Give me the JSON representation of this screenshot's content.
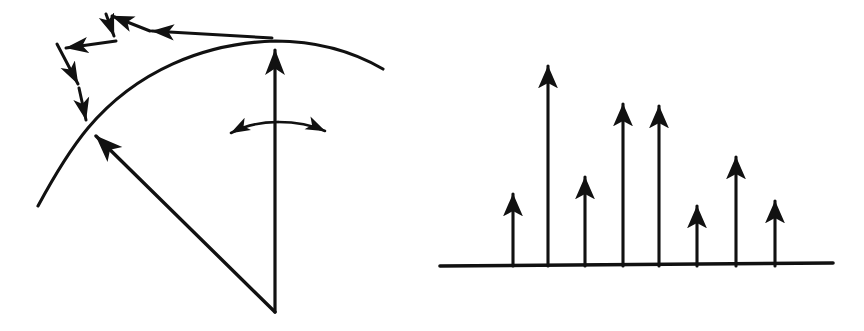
{
  "figure": {
    "width": 864,
    "height": 331,
    "background_color": "#ffffff",
    "ink_color": "#111111",
    "panel_count": 2,
    "caption": ""
  },
  "panels": [
    {
      "id": "left-panel",
      "name": "scattering-geometry-diagram",
      "label": "",
      "description": "Hand-drawn scattering / wavefront diagram: a zigzag arrowed ray path travelling leftward and downward to a vertex, a curved wavefront arc through that vertex, a straight radius arrow from an apex to the vertex, a vertical axis arrow, and a double-headed arc indicating angular sweep.",
      "elements": [
        {
          "name": "zigzag-ray-path",
          "type": "polyline-with-arrowheads",
          "direction": "right-to-left-then-down",
          "segment_count": 6,
          "arrowhead_count": 5,
          "points": [
            [
              272,
              38
            ],
            [
              118,
              29
            ],
            [
              107,
              13
            ],
            [
              115,
              39
            ],
            [
              89,
              53
            ],
            [
              57,
              43
            ],
            [
              71,
              57
            ],
            [
              81,
              90
            ],
            [
              80,
              104
            ],
            [
              88,
              128
            ]
          ]
        },
        {
          "name": "wavefront-arc",
          "type": "curve",
          "start": [
            38,
            205
          ],
          "through": [
            88,
            128
          ],
          "apex": [
            275,
            42
          ],
          "end": [
            383,
            68
          ]
        },
        {
          "name": "radius-arrow",
          "type": "line-with-arrowhead",
          "from": [
            275,
            312
          ],
          "to": [
            88,
            128
          ],
          "arrow_at": "to"
        },
        {
          "name": "vertical-axis-arrow",
          "type": "line-with-arrowhead",
          "from": [
            275,
            312
          ],
          "to": [
            275,
            42
          ],
          "arrow_at": "to"
        },
        {
          "name": "angular-sweep-double-arrow",
          "type": "arc-with-two-arrowheads",
          "left_tip": [
            221,
            136
          ],
          "right_tip": [
            334,
            134
          ],
          "arc_apex": [
            278,
            122
          ]
        }
      ]
    },
    {
      "id": "right-panel",
      "name": "stem-spectrum-diagram",
      "label": "",
      "description": "Hand-drawn stem (impulse) plot: a horizontal baseline with eight upward arrows of differing heights, resembling a discrete line spectrum.",
      "elements": [
        {
          "name": "baseline-axis",
          "type": "line",
          "from": [
            440,
            266
          ],
          "to": [
            833,
            263
          ]
        },
        {
          "name": "impulse-stems",
          "type": "arrow-group",
          "count": 8
        }
      ]
    }
  ],
  "chart_data": {
    "type": "bar",
    "title": "",
    "subtitle": "",
    "xlabel": "",
    "ylabel": "",
    "grid": false,
    "legend": null,
    "axis_visible": {
      "x": true,
      "y": false
    },
    "baseline_y": 265,
    "categories": [
      "1",
      "2",
      "3",
      "4",
      "5",
      "6",
      "7",
      "8"
    ],
    "x_pixels": [
      513,
      548,
      585,
      623,
      659,
      697,
      736,
      775
    ],
    "tip_y_pixels": [
      185,
      57,
      168,
      95,
      97,
      197,
      148,
      192
    ],
    "values": [
      80,
      208,
      97,
      170,
      168,
      68,
      117,
      73
    ],
    "ylim": [
      0,
      230
    ],
    "note": "Heights read as baseline(265px) minus arrow-tip y in image pixels."
  }
}
